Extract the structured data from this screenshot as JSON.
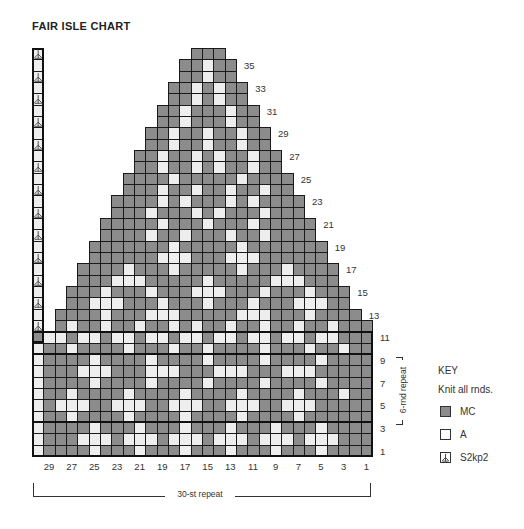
{
  "title": "FAIR ISLE CHART",
  "colors": {
    "MC": "#8c8c8c",
    "A": "#eeeeee",
    "grid_line": "#1a1a1a",
    "outline": "#111111"
  },
  "chart_data": {
    "type": "table",
    "title": "FAIR ISLE CHART",
    "columns": 30,
    "rows_count": 36,
    "rows": [
      {
        "row": 36,
        "cells": "S.............MMM............."
      },
      {
        "row": 35,
        "cells": "L............MMAMM............"
      },
      {
        "row": 34,
        "cells": "S............MMAMM............"
      },
      {
        "row": 33,
        "cells": "L...........MMAMAMM..........."
      },
      {
        "row": 32,
        "cells": "S...........MMAMAMM..........."
      },
      {
        "row": 31,
        "cells": "L..........MMAMMMAMM.........."
      },
      {
        "row": 30,
        "cells": "S..........MMAMMMAMM.........."
      },
      {
        "row": 29,
        "cells": "L.........MMAMMAMMAMM........."
      },
      {
        "row": 28,
        "cells": "S.........MMAMMAMMAMM........."
      },
      {
        "row": 27,
        "cells": "L........MMAMMAMAMMAMM........"
      },
      {
        "row": 26,
        "cells": "S........MMAMMAMAMMAMM........"
      },
      {
        "row": 25,
        "cells": "L.......MMMMAMMMMMAMMMM......."
      },
      {
        "row": 24,
        "cells": "S.......MMMAMMAMMAMMAMM......."
      },
      {
        "row": 23,
        "cells": "L......MMMMAMAMMMAMAMMMM......"
      },
      {
        "row": 22,
        "cells": "S......MMMAMMMAMAMMMAMMM......"
      },
      {
        "row": 21,
        "cells": "L.....MMMMMAMMMAMMMAMMMMM....."
      },
      {
        "row": 20,
        "cells": "S.....MMMMAMMAMMMAMMAMMMM....."
      },
      {
        "row": 19,
        "cells": "L....MMMMMMMAMMMMMAMMMMMMM...."
      },
      {
        "row": 18,
        "cells": "S....MMMMMMAAAMMMAAAMMMMMM...."
      },
      {
        "row": 17,
        "cells": "L...MMMMAMMMAMMMMMAMMMAMMMM..."
      },
      {
        "row": 16,
        "cells": "S...MMMAAAMMMMMAMMMMMAAAMMM..."
      },
      {
        "row": 15,
        "cells": "L..MMMAMMMAMMMAAAMMMAMMMAMMM.."
      },
      {
        "row": 14,
        "cells": "S..MMAAAMMMAMMMAMMMAMMMAAAMM.."
      },
      {
        "row": 13,
        "cells": "L.MMMMAMMMAAAMMMMMAAAMMMAMMMM."
      },
      {
        "row": 12,
        "cells": "S.MAMMAMMAMMAMAMMAMMAMMAMMAMMM"
      },
      {
        "row": 11,
        "cells": "MAAMAAMAAMAAMAAMAAMAAMAAMAAMMM"
      },
      {
        "row": 10,
        "cells": "AMMAMMMMAMMMAMMAMMMMAMMMAMMAMM"
      },
      {
        "row": 9,
        "cells": "AMMMMAMMMMAMMMMAMMMMAMMMMAMMMM"
      },
      {
        "row": 8,
        "cells": "AMMMAAAMMMAAAMMMAAAMMMAAAMMMMM"
      },
      {
        "row": 7,
        "cells": "AMMMMAMMMMAMMMMAMMMMAMMMMAMMMM"
      },
      {
        "row": 6,
        "cells": "AMMAMMMMAMMMMAMMMMAMMMMAMMMAMM"
      },
      {
        "row": 5,
        "cells": "AMAAAMMAAAMMAAAMMAAAMMAAAMMMMM"
      },
      {
        "row": 4,
        "cells": "AMMAMMMMAMMMMAMMMMAMMMMAMMMMMM"
      },
      {
        "row": 3,
        "cells": "AMMMMAMMMAMMMAMMMAMMMAMMMAMMMM"
      },
      {
        "row": 2,
        "cells": "AMMMAAAMAAAMAAAMAAAMAAAMAAAMMM"
      },
      {
        "row": 1,
        "cells": "AMMMMAMMMAMMMAMMMAMMMAMMMAMMMM"
      }
    ],
    "band_dividers_after_row": [
      3,
      9
    ],
    "right_row_labels": [
      {
        "row": 1,
        "label": "1"
      },
      {
        "row": 3,
        "label": "3"
      },
      {
        "row": 5,
        "label": "5"
      },
      {
        "row": 7,
        "label": "7"
      },
      {
        "row": 9,
        "label": "9"
      },
      {
        "row": 11,
        "label": "11"
      },
      {
        "row": 13,
        "label": "13"
      },
      {
        "row": 15,
        "label": "15"
      },
      {
        "row": 17,
        "label": "17"
      },
      {
        "row": 19,
        "label": "19"
      },
      {
        "row": 21,
        "label": "21"
      },
      {
        "row": 23,
        "label": "23"
      },
      {
        "row": 25,
        "label": "25"
      },
      {
        "row": 27,
        "label": "27"
      },
      {
        "row": 29,
        "label": "29"
      },
      {
        "row": 31,
        "label": "31"
      },
      {
        "row": 33,
        "label": "33"
      },
      {
        "row": 35,
        "label": "35"
      }
    ],
    "column_labels": [
      "29",
      "27",
      "25",
      "23",
      "21",
      "19",
      "17",
      "15",
      "13",
      "11",
      "9",
      "7",
      "5",
      "3",
      "1"
    ],
    "annotations": {
      "stitch_repeat": "30-st repeat",
      "round_repeat": "6-rnd repeat",
      "round_repeat_rows": [
        4,
        9
      ]
    }
  },
  "key": {
    "title": "KEY",
    "subtitle": "Knit all rnds.",
    "items": [
      {
        "symbol": "MC",
        "label": "MC"
      },
      {
        "symbol": "A",
        "label": "A"
      },
      {
        "symbol": "S",
        "label": "S2kp2"
      }
    ]
  }
}
